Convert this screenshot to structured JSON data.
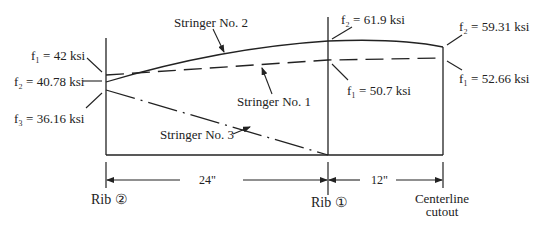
{
  "diagram": {
    "stringers": [
      {
        "name": "Stringer No. 1",
        "style": "dashed",
        "values": [
          {
            "station": "Rib 2",
            "label": "f1 = 42 ksi"
          },
          {
            "station": "Rib 1",
            "label": "f1 = 50.7 ksi"
          },
          {
            "station": "Centerline cutout",
            "label": "f1 = 52.66 ksi"
          }
        ]
      },
      {
        "name": "Stringer No. 2",
        "style": "solid",
        "values": [
          {
            "station": "Rib 2",
            "label": "f2 = 40.78 ksi"
          },
          {
            "station": "Rib 1",
            "label": "f2 = 61.9 ksi"
          },
          {
            "station": "Centerline cutout",
            "label": "f2 = 59.31 ksi"
          }
        ]
      },
      {
        "name": "Stringer No. 3",
        "style": "dash-dot",
        "values": [
          {
            "station": "Rib 2",
            "label": "f3 = 36.16 ksi"
          },
          {
            "station": "Rib 1",
            "label": "0"
          }
        ]
      }
    ],
    "labels": {
      "stringer1": "Stringer No. 1",
      "stringer2": "Stringer No. 2",
      "stringer3": "Stringer No. 3",
      "f1_rib2": "f₁ = 42 ksi",
      "f2_rib2": "f₂ = 40.78 ksi",
      "f3_rib2": "f₃ = 36.16 ksi",
      "f2_rib1": "f₂ = 61.9 ksi",
      "f1_rib1": "f₁ = 50.7 ksi",
      "f2_cl": "f₂ = 59.31 ksi",
      "f1_cl": "f₁ = 52.66 ksi",
      "dim_24": "24\"",
      "dim_12": "12\"",
      "rib2": "Rib ②",
      "rib1": "Rib ①",
      "cl_line1": "Centerline",
      "cl_line2": "cutout"
    }
  }
}
